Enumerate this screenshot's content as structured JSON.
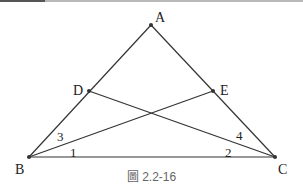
{
  "figure": {
    "caption": "圖 2.2-16",
    "line_color": "#333333",
    "points": {
      "A": {
        "label": "A",
        "x": 151,
        "y": 25
      },
      "B": {
        "label": "B",
        "x": 29,
        "y": 157
      },
      "C": {
        "label": "C",
        "x": 275,
        "y": 157
      },
      "D": {
        "label": "D",
        "x": 89,
        "y": 91
      },
      "E": {
        "label": "E",
        "x": 213,
        "y": 91
      }
    },
    "segments": [
      "AB",
      "AC",
      "BC",
      "BE",
      "CD"
    ],
    "angle_labels": {
      "angle1": "1",
      "angle2": "2",
      "angle3": "3",
      "angle4": "4"
    }
  }
}
